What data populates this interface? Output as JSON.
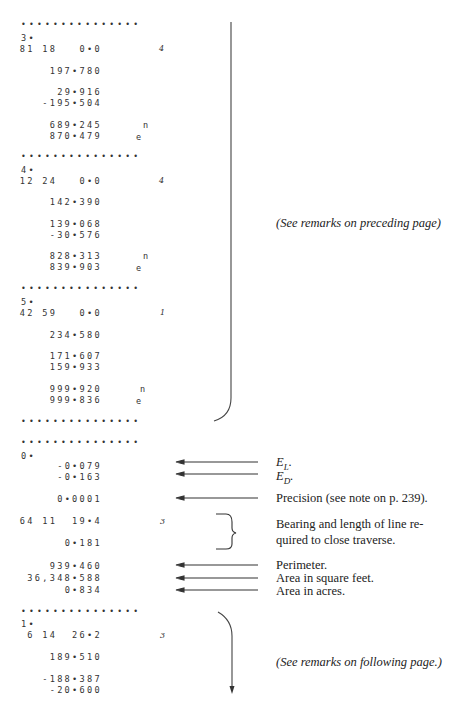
{
  "blocks": [
    {
      "id": "3",
      "label": "3•",
      "bearing": "81 18   0•0",
      "quadrant_mark": "4",
      "length": "197•780",
      "lat": "29•916",
      "dep": "-195•504",
      "north": "689•245",
      "east": "870•479",
      "north_tag": "n",
      "east_tag": "e"
    },
    {
      "id": "4",
      "label": "4•",
      "bearing": "12 24   0•0",
      "quadrant_mark": "4",
      "length": "142•390",
      "lat": "139•068",
      "dep": "-30•576",
      "north": "828•313",
      "east": "839•903",
      "north_tag": "n",
      "east_tag": "e"
    },
    {
      "id": "5",
      "label": "5•",
      "bearing": "42 59   0•0",
      "quadrant_mark": "1",
      "length": "234•580",
      "lat": "171•607",
      "dep": "159•933",
      "north": "999•920",
      "east": "999•836",
      "north_tag": "n",
      "east_tag": "e"
    }
  ],
  "separator": "•••••••••••••••",
  "closure": {
    "label": "0•",
    "el": "-0•079",
    "ed": "-0•163",
    "precision": "0•0001",
    "bearing": "64 11  19•4",
    "quadrant_mark": "3",
    "length": "0•181",
    "perimeter": "939•460",
    "area_sqft": "36,348•588",
    "area_acres": "0•834"
  },
  "next_block": {
    "label": "1•",
    "bearing": "6 14  26•2",
    "quadrant_mark": "3",
    "length": "189•510",
    "lat": "-188•387",
    "dep": "-20•600"
  },
  "annotations": {
    "preceding_remark": "(See remarks on preceding page)",
    "el_label": "E",
    "el_sub": "L",
    "ed_label": "E",
    "ed_sub": "D",
    "precision_note": "Precision (see note on p. 239).",
    "bearing_note_line1": "Bearing and length of line re-",
    "bearing_note_line2": "quired to close traverse.",
    "perimeter_note": "Perimeter.",
    "sqft_note": "Area in square feet.",
    "acres_note": "Area in acres.",
    "following_remark": "(See remarks on following page.)"
  }
}
